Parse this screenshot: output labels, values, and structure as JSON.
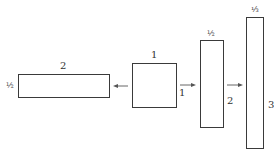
{
  "diagram": {
    "shapes": [
      {
        "id": "rect-wide",
        "top_label": "2",
        "side_label": "½",
        "side": "left"
      },
      {
        "id": "unit-square",
        "top_label": "1",
        "side_label": "1",
        "side": "right"
      },
      {
        "id": "rect-tall",
        "top_label": "½",
        "side_label": "2",
        "side": "right"
      },
      {
        "id": "rect-tallest",
        "top_label": "⅓",
        "side_label": "3",
        "side": "right"
      }
    ],
    "arrows": [
      {
        "from": "unit-square",
        "to": "rect-wide",
        "direction": "left"
      },
      {
        "from": "unit-square",
        "to": "rect-tall",
        "direction": "right"
      },
      {
        "from": "rect-tall",
        "to": "rect-tallest",
        "direction": "right"
      }
    ],
    "colors": {
      "stroke": "#3a3a3a",
      "text": "#333333",
      "arrow": "#555555"
    }
  }
}
